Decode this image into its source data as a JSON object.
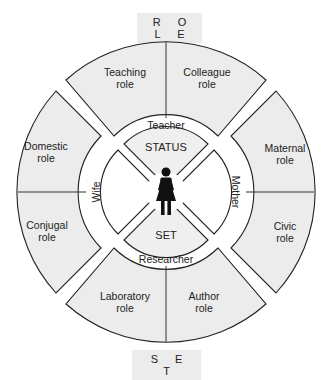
{
  "diagram": {
    "top_label": "R O L E",
    "bottom_label": "S E T",
    "colors": {
      "segment_fill": "#ececec",
      "stroke": "#222222",
      "center_shade": "#efefef"
    },
    "status_groups": [
      {
        "position": "top",
        "status": "Teacher",
        "roles": [
          "Teaching role",
          "Colleague role"
        ]
      },
      {
        "position": "left",
        "status": "Wife",
        "roles": [
          "Domestic role",
          "Conjugal role"
        ]
      },
      {
        "position": "right",
        "status": "Mother",
        "roles": [
          "Maternal role",
          "Civic role"
        ]
      },
      {
        "position": "bottom",
        "status": "Researcher",
        "roles": [
          "Laboratory role",
          "Author role"
        ]
      }
    ],
    "center": {
      "top_label": "STATUS",
      "bottom_label": "SET",
      "icon": "female-person-icon"
    },
    "roles": {
      "teaching": [
        "Teaching",
        "role"
      ],
      "colleague": [
        "Colleague",
        "role"
      ],
      "domestic": [
        "Domestic",
        "role"
      ],
      "conjugal": [
        "Conjugal",
        "role"
      ],
      "maternal": [
        "Maternal",
        "role"
      ],
      "civic": [
        "Civic",
        "role"
      ],
      "laboratory": [
        "Laboratory",
        "role"
      ],
      "author": [
        "Author",
        "role"
      ]
    },
    "statuses": {
      "teacher": "Teacher",
      "wife": "Wife",
      "mother": "Mother",
      "researcher": "Researcher"
    }
  }
}
